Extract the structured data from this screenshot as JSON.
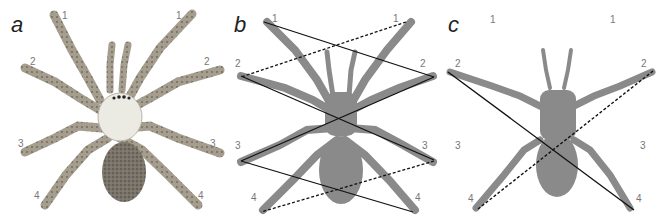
{
  "figure": {
    "panels": [
      {
        "letter": "a",
        "style": "illustration",
        "labels": {
          "l1": "1",
          "r1": "1",
          "l2": "2",
          "r2": "2",
          "l3": "3",
          "r3": "3",
          "l4": "4",
          "r4": "4"
        }
      },
      {
        "letter": "b",
        "style": "silhouette-with-zigzag-lines",
        "labels": {
          "l1": "1",
          "r1": "1",
          "l2": "2",
          "r2": "2",
          "l3": "3",
          "r3": "3",
          "l4": "4",
          "r4": "4"
        }
      },
      {
        "letter": "c",
        "style": "silhouette-with-cross-lines",
        "labels": {
          "l1": "1",
          "r1": "1",
          "l2": "2",
          "r2": "2",
          "l3": "3",
          "r3": "3",
          "l4": "4",
          "r4": "4"
        }
      }
    ],
    "colors": {
      "silhouette": "#8a8a8a",
      "line": "#111111",
      "label": "#777777",
      "illustration_leg": "#9a9384",
      "illustration_carapace": "#ecebe3",
      "illustration_abdomen": "#6b665d"
    }
  }
}
